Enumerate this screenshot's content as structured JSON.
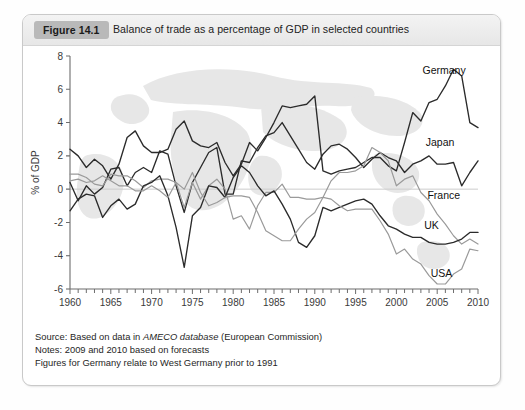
{
  "figure": {
    "badge": "Figure 14.1",
    "title": "Balance of trade as a percentage of GDP in selected countries"
  },
  "notes": {
    "source_prefix": "Source: Based on data in ",
    "source_italic": "AMECO database",
    "source_suffix": " (European Commission)",
    "line2": "Notes: 2009 and 2010 based on forecasts",
    "line3": "Figures for Germany relate to West Germany prior to 1991"
  },
  "colors": {
    "dark_line": "#2b2b2b",
    "light_line": "#9a9a9a",
    "axis": "#6d6d6d",
    "zero_line": "#cccccc",
    "badge_bg": "#b9b9b9",
    "panel_border": "#c9c9c9",
    "watermark": "#e6e6e6"
  },
  "chart_data": {
    "type": "line",
    "title": "Balance of trade as a percentage of GDP in selected countries",
    "xlabel": "",
    "ylabel": "% of GDP",
    "xlim": [
      1960,
      2010
    ],
    "ylim": [
      -6,
      8
    ],
    "ytick_labels": [
      "8",
      "6",
      "4",
      "2",
      "0",
      "-2",
      "-4",
      "-6"
    ],
    "yticks": [
      8,
      6,
      4,
      2,
      0,
      -2,
      -4,
      -6
    ],
    "xtick_labels": [
      "1960",
      "1965",
      "1970",
      "1975",
      "1980",
      "1985",
      "1990",
      "1995",
      "2000",
      "2005",
      "2010"
    ],
    "xticks": [
      1960,
      1965,
      1970,
      1975,
      1980,
      1985,
      1990,
      1995,
      2000,
      2005,
      2010
    ],
    "minor_xtick_step": 1,
    "grid": false,
    "legend": "inline-labels",
    "x": [
      1960,
      1961,
      1962,
      1963,
      1964,
      1965,
      1966,
      1967,
      1968,
      1969,
      1970,
      1971,
      1972,
      1973,
      1974,
      1975,
      1976,
      1977,
      1978,
      1979,
      1980,
      1981,
      1982,
      1983,
      1984,
      1985,
      1986,
      1987,
      1988,
      1989,
      1990,
      1991,
      1992,
      1993,
      1994,
      1995,
      1996,
      1997,
      1998,
      1999,
      2000,
      2001,
      2002,
      2003,
      2004,
      2005,
      2006,
      2007,
      2008,
      2009,
      2010
    ],
    "series": [
      {
        "name": "Germany",
        "color": "#2b2b2b",
        "label_x": 2003.2,
        "label_y": 6.9,
        "values": [
          2.4,
          2.0,
          1.3,
          1.8,
          1.4,
          0.6,
          1.5,
          3.1,
          3.5,
          2.6,
          2.2,
          2.2,
          2.4,
          3.6,
          4.1,
          2.9,
          2.6,
          2.5,
          2.8,
          1.6,
          0.8,
          1.5,
          2.8,
          2.3,
          3.1,
          4.0,
          5.0,
          4.9,
          5.0,
          5.1,
          5.6,
          1.1,
          0.9,
          1.1,
          1.2,
          1.3,
          1.6,
          1.9,
          1.9,
          1.4,
          1.1,
          2.8,
          4.6,
          4.1,
          5.2,
          5.4,
          6.2,
          7.2,
          6.8,
          4.0,
          3.7
        ]
      },
      {
        "name": "Japan",
        "color": "#2b2b2b",
        "label_x": 2003.6,
        "label_y": 2.6,
        "values": [
          0.4,
          -0.7,
          0.2,
          -0.3,
          0.1,
          1.2,
          1.3,
          0.2,
          1.0,
          1.3,
          1.0,
          2.3,
          2.1,
          0.2,
          -1.4,
          0.4,
          1.3,
          2.2,
          2.5,
          -0.3,
          -0.3,
          1.7,
          1.6,
          2.5,
          3.2,
          3.4,
          4.0,
          3.2,
          2.4,
          1.6,
          1.2,
          2.1,
          2.6,
          2.7,
          2.4,
          1.9,
          1.3,
          1.8,
          2.2,
          1.9,
          1.7,
          1.0,
          1.5,
          1.7,
          2.0,
          1.5,
          1.5,
          1.6,
          0.2,
          1.0,
          1.7
        ]
      },
      {
        "name": "France",
        "color": "#9a9a9a",
        "label_x": 2003.8,
        "label_y": -0.6,
        "values": [
          0.9,
          0.9,
          0.7,
          0.3,
          0.2,
          0.9,
          0.8,
          0.8,
          0.5,
          0.1,
          0.5,
          0.6,
          0.6,
          0.4,
          -1.1,
          0.4,
          -0.6,
          0.2,
          0.6,
          0.0,
          -1.8,
          -1.6,
          -2.4,
          -1.0,
          -0.2,
          -0.2,
          0.3,
          -0.5,
          -0.5,
          -0.6,
          -0.6,
          -0.5,
          0.5,
          1.0,
          1.0,
          1.1,
          1.4,
          2.5,
          2.2,
          1.7,
          0.2,
          0.6,
          0.8,
          -0.2,
          -0.7,
          -1.5,
          -2.1,
          -2.8,
          -3.3,
          -3.0,
          -3.3
        ]
      },
      {
        "name": "UK",
        "color": "#2b2b2b",
        "label_x": 2003.4,
        "label_y": -2.4,
        "values": [
          -1.3,
          -0.6,
          -0.3,
          -0.4,
          -1.7,
          -1.0,
          -0.6,
          -1.2,
          -0.9,
          0.2,
          0.4,
          0.8,
          -0.4,
          -2.3,
          -4.7,
          -1.6,
          -1.1,
          0.2,
          0.1,
          -0.5,
          0.7,
          1.4,
          1.0,
          0.2,
          -0.4,
          -0.1,
          -0.9,
          -1.8,
          -3.2,
          -3.5,
          -2.8,
          -1.1,
          -1.3,
          -1.1,
          -0.9,
          -0.7,
          -0.6,
          -0.9,
          -1.6,
          -2.2,
          -2.4,
          -2.7,
          -2.9,
          -2.9,
          -3.2,
          -3.3,
          -3.3,
          -3.2,
          -3.0,
          -2.6,
          -2.6
        ]
      },
      {
        "name": "USA",
        "color": "#9a9a9a",
        "label_x": 2004.2,
        "label_y": -5.3,
        "values": [
          0.5,
          0.6,
          0.4,
          0.5,
          0.8,
          0.5,
          0.2,
          0.2,
          -0.1,
          -0.1,
          0.2,
          -0.1,
          -0.5,
          0.4,
          0.0,
          1.0,
          -0.2,
          -1.0,
          -0.8,
          -0.5,
          -0.4,
          -0.4,
          -0.5,
          -1.4,
          -2.5,
          -2.8,
          -3.1,
          -3.1,
          -2.4,
          -1.8,
          -1.4,
          -0.5,
          -0.6,
          -1.0,
          -1.3,
          -1.2,
          -1.2,
          -1.2,
          -1.9,
          -2.7,
          -3.9,
          -3.6,
          -4.2,
          -4.5,
          -5.2,
          -5.7,
          -5.7,
          -5.1,
          -4.8,
          -3.6,
          -3.7
        ]
      }
    ]
  }
}
